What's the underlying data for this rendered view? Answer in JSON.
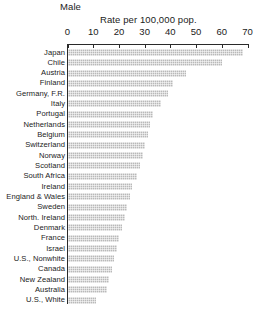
{
  "chart_data": {
    "type": "bar",
    "title": "Male",
    "subtitle": "Rate per 100,000 pop.",
    "orientation": "horizontal",
    "xlabel": "Rate per 100,000 pop.",
    "ylabel": "",
    "xlim": [
      0,
      70
    ],
    "xticks": [
      0,
      10,
      20,
      30,
      40,
      50,
      60,
      70
    ],
    "grid": false,
    "legend": null,
    "categories": [
      "Japan",
      "Chile",
      "Austria",
      "Finland",
      "Germany, F.R.",
      "Italy",
      "Portugal",
      "Netherlands",
      "Belgium",
      "Switzerland",
      "Norway",
      "Scotland",
      "South Africa",
      "Ireland",
      "England & Wales",
      "Sweden",
      "North. Ireland",
      "Denmark",
      "France",
      "Israel",
      "U.S., Nonwhite",
      "Canada",
      "New Zealand",
      "Australia",
      "U.S., White"
    ],
    "values": [
      68,
      60,
      46,
      41,
      39,
      36,
      33,
      32,
      31,
      30,
      29,
      28,
      27,
      25,
      24,
      23,
      22,
      21,
      20,
      19,
      18,
      17,
      16,
      15,
      11
    ],
    "bar_color": "#b9b9b9",
    "axis_color": "#2a2a2a"
  }
}
